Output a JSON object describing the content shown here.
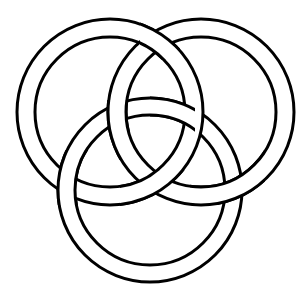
{
  "diagram": {
    "type": "interlaced-rings",
    "colors": {
      "background": "#ffffff",
      "stroke": "#000000",
      "band_fill": "#ffffff"
    },
    "stroke_width": 3,
    "rings": [
      {
        "name": "left-ring",
        "cx": 110,
        "cy": 112,
        "outer_r": 93,
        "inner_r": 75
      },
      {
        "name": "right-ring",
        "cx": 201,
        "cy": 112,
        "outer_r": 93,
        "inner_r": 75
      },
      {
        "name": "bottom-ring",
        "cx": 150,
        "cy": 190,
        "outer_r": 92,
        "inner_r": 75
      }
    ]
  }
}
